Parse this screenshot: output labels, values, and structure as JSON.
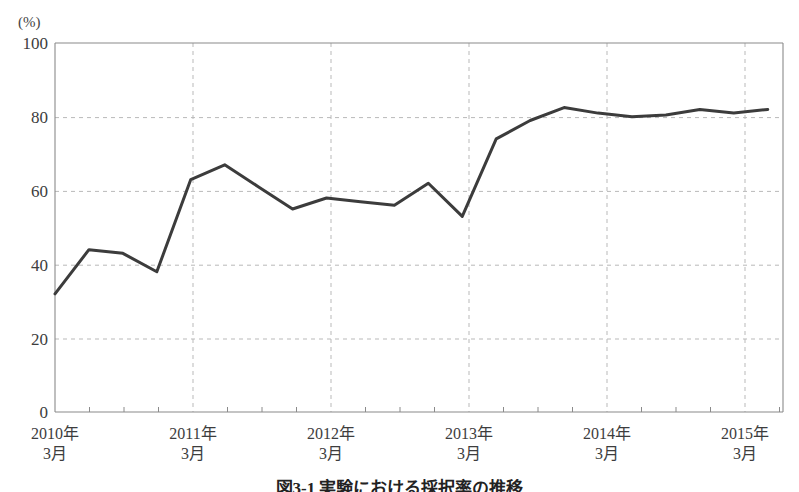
{
  "chart_data": {
    "type": "line",
    "title": "",
    "unit_label": "(%)",
    "xlabel": "",
    "ylabel": "",
    "ylim": [
      0,
      100
    ],
    "ytick_values": [
      0,
      20,
      40,
      60,
      80,
      100
    ],
    "ytick_labels": [
      "0",
      "20",
      "40",
      "60",
      "80",
      "100"
    ],
    "grid": "horizontal-and-vertical-dashed",
    "legend": "none",
    "x_major_labels": [
      {
        "line1": "2010年",
        "line2": "3月",
        "index": 0
      },
      {
        "line1": "2011年",
        "line2": "3月",
        "index": 4
      },
      {
        "line1": "2012年",
        "line2": "3月",
        "index": 8
      },
      {
        "line1": "2013年",
        "line2": "3月",
        "index": 12
      },
      {
        "line1": "2014年",
        "line2": "3月",
        "index": 16
      },
      {
        "line1": "2015年",
        "line2": "3月",
        "index": 20
      }
    ],
    "x": [
      "2010年3月",
      "2010年6月",
      "2010年9月",
      "2010年12月",
      "2011年3月",
      "2011年6月",
      "2011年9月",
      "2011年12月",
      "2012年3月",
      "2012年6月",
      "2012年9月",
      "2012年12月",
      "2013年3月",
      "2013年6月",
      "2013年9月",
      "2013年12月",
      "2014年3月",
      "2014年6月",
      "2014年9月",
      "2014年12月",
      "2015年3月",
      "2015年6月"
    ],
    "values": [
      32,
      44,
      43,
      38,
      63,
      67,
      61,
      55,
      58,
      57,
      56,
      62,
      53,
      74,
      79,
      82.5,
      81,
      80,
      80.5,
      82,
      81,
      82
    ],
    "series_color": "#3c3c3c",
    "series_width": 3,
    "grid_color": "#b9b9b9",
    "axis_color": "#888888"
  },
  "caption": {
    "text": "図3-1 実験における採択率の推移"
  }
}
